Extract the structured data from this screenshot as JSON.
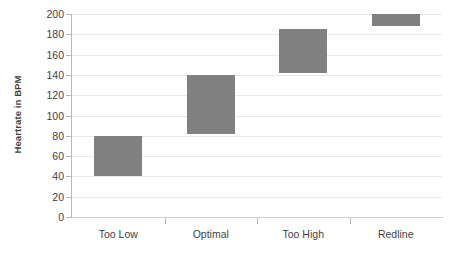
{
  "chart_data": {
    "type": "bar",
    "subtype": "floating-range-bar",
    "title": "",
    "xlabel": "",
    "ylabel": "Heartrate in BPM",
    "categories": [
      "Too Low",
      "Optimal",
      "Too High",
      "Redline"
    ],
    "series": [
      {
        "name": "Heartrate zone",
        "ranges": [
          {
            "category": "Too Low",
            "low": 40,
            "high": 80
          },
          {
            "category": "Optimal",
            "low": 82,
            "high": 140
          },
          {
            "category": "Too High",
            "low": 142,
            "high": 185
          },
          {
            "category": "Redline",
            "low": 188,
            "high": 200
          }
        ],
        "color": "#808080"
      }
    ],
    "ylim": [
      0,
      200
    ],
    "ytick_step": 20,
    "yticks": [
      0,
      20,
      40,
      60,
      80,
      100,
      120,
      140,
      160,
      180,
      200
    ],
    "ytick_labels": [
      "0",
      "20",
      "40",
      "60",
      "80",
      "100",
      "120",
      "140",
      "160",
      "180",
      "200"
    ],
    "grid": true,
    "grid_axis": "y",
    "grid_color": "#e8e8e8",
    "axis_color": "#b9b9b9",
    "legend": false,
    "legend_position": "none",
    "background": "#ffffff",
    "text_color": "#3f3f3f"
  },
  "axes": {
    "y_title": "Heartrate in BPM"
  }
}
